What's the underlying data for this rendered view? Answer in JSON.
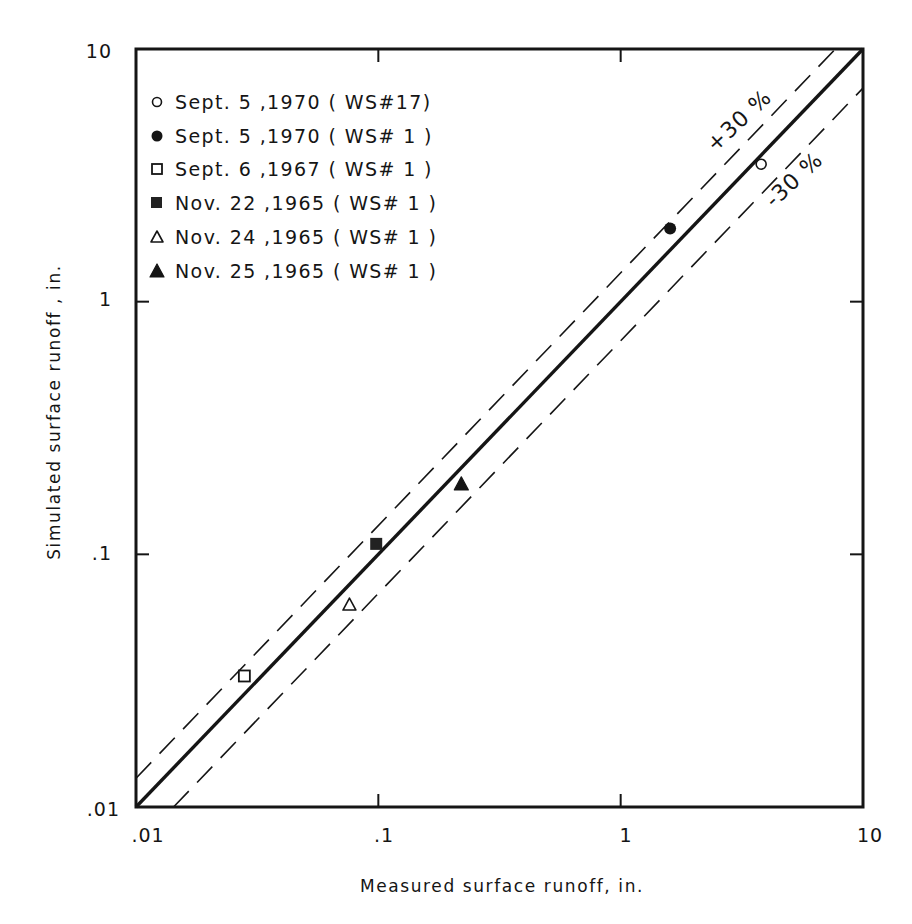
{
  "chart_data": {
    "type": "scatter",
    "title": "",
    "xlabel": "Measured surface runoff,  in.",
    "ylabel": "Simulated surface runoff ,  in.",
    "xscale": "log",
    "yscale": "log",
    "xlim": [
      0.01,
      10
    ],
    "ylim": [
      0.01,
      10
    ],
    "x_ticks": [
      0.01,
      0.1,
      1,
      10
    ],
    "x_tick_labels": [
      ".01",
      ".1",
      "1",
      "10"
    ],
    "y_ticks": [
      0.01,
      0.1,
      1,
      10
    ],
    "y_tick_labels": [
      ".01",
      ".1",
      "1",
      "10"
    ],
    "grid": false,
    "legend_position": "upper-left (inside plot)",
    "reference_lines": [
      {
        "name": "1:1 line",
        "style": "solid-thick",
        "factor": 1.0,
        "label": ""
      },
      {
        "name": "+30% line",
        "style": "dashed",
        "factor": 1.3,
        "label": "+30 %"
      },
      {
        "name": "-30% line",
        "style": "dashed",
        "factor": 0.7,
        "label": "-30 %"
      }
    ],
    "series": [
      {
        "name": "Sept. 5 ,1970 (WS#17)",
        "marker": "open-circle",
        "x": [
          3.8
        ],
        "y": [
          3.5
        ]
      },
      {
        "name": "Sept. 5 ,1970 (WS# 1 )",
        "marker": "filled-circle",
        "x": [
          1.6
        ],
        "y": [
          1.95
        ]
      },
      {
        "name": "Sept. 6 ,1967 (WS# 1 )",
        "marker": "open-square",
        "x": [
          0.028
        ],
        "y": [
          0.033
        ]
      },
      {
        "name": "Nov. 22 ,1965 (WS# 1 )",
        "marker": "filled-square",
        "x": [
          0.098
        ],
        "y": [
          0.11
        ]
      },
      {
        "name": "Nov. 24 ,1965 (WS# 1 )",
        "marker": "open-triangle",
        "x": [
          0.076
        ],
        "y": [
          0.063
        ]
      },
      {
        "name": "Nov. 25 ,1965 (WS# 1 )",
        "marker": "filled-triangle",
        "x": [
          0.22
        ],
        "y": [
          0.19
        ]
      }
    ]
  },
  "axes": {
    "x_title": "Measured surface runoff,  in.",
    "y_title": "Simulated surface runoff ,  in.",
    "x_ticks": [
      ".01",
      ".1",
      "1",
      "10"
    ],
    "y_ticks": [
      ".01",
      ".1",
      "1",
      "10"
    ]
  },
  "legend": {
    "items": [
      {
        "label": "Sept. 5 ,1970 ( WS#17)",
        "marker": "open-circle"
      },
      {
        "label": "Sept. 5 ,1970 ( WS# 1 )",
        "marker": "filled-circle"
      },
      {
        "label": "Sept. 6 ,1967 ( WS# 1 )",
        "marker": "open-square"
      },
      {
        "label": "Nov. 22 ,1965 ( WS# 1 )",
        "marker": "filled-square"
      },
      {
        "label": "Nov. 24 ,1965 ( WS# 1 )",
        "marker": "open-triangle"
      },
      {
        "label": "Nov. 25 ,1965 ( WS# 1 )",
        "marker": "filled-triangle"
      }
    ]
  },
  "band_labels": {
    "plus": "+30 %",
    "minus": "-30 %"
  },
  "colors": {
    "ink": "#151515",
    "background": "#ffffff"
  }
}
